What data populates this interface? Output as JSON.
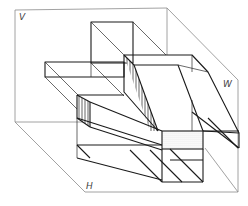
{
  "diagram": {
    "type": "three-view projection box (orthographic planes with object)",
    "planes": [
      {
        "id": "V",
        "label": "V",
        "meaning": "vertical (frontal) projection plane"
      },
      {
        "id": "W",
        "label": "W",
        "meaning": "side (profile) projection plane"
      },
      {
        "id": "H",
        "label": "H",
        "meaning": "horizontal projection plane"
      }
    ],
    "hatching": {
      "vertical_stripes": "sloped side faces of object",
      "dotted": "front face of base block"
    },
    "colors": {
      "frame": "#8a8a8a",
      "object_lines": "#1a1a1a",
      "background": "#ffffff"
    }
  }
}
